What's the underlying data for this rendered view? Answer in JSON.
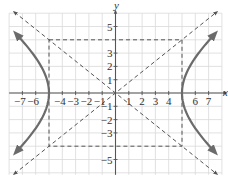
{
  "chart_data": {
    "type": "line",
    "title": "",
    "equation": "x^2/25 - y^2/16 = 1",
    "xlabel": "x",
    "ylabel": "y",
    "xlim": [
      -8,
      8
    ],
    "ylim": [
      -6,
      6
    ],
    "grid": true,
    "x_tick_labels": [
      "-7",
      "-6",
      "-4",
      "-3",
      "-2",
      "-1",
      "1",
      "2",
      "3",
      "4",
      "6",
      "7"
    ],
    "x_tick_values": [
      -7,
      -6,
      -4,
      -3,
      -2,
      -1,
      1,
      2,
      3,
      4,
      6,
      7
    ],
    "y_tick_labels": [
      "5",
      "3",
      "2",
      "1",
      "-1",
      "-2",
      "-3",
      "-5"
    ],
    "y_tick_values": [
      5,
      3,
      2,
      1,
      -1,
      -2,
      -3,
      -5
    ],
    "vertices": [
      [
        -5,
        0
      ],
      [
        5,
        0
      ]
    ],
    "fundamental_rectangle": {
      "x": [
        -5,
        5
      ],
      "y": [
        -4,
        4
      ],
      "style": "dashed"
    },
    "asymptotes": [
      {
        "name": "y = 4/5 x",
        "slope": 0.8,
        "style": "dashed"
      },
      {
        "name": "y = -4/5 x",
        "slope": -0.8,
        "style": "dashed"
      }
    ],
    "series": [
      {
        "name": "right branch",
        "points": [
          [
            7.6,
            4.6
          ],
          [
            7,
            3.92
          ],
          [
            6,
            2.65
          ],
          [
            5.5,
            1.83
          ],
          [
            5,
            0
          ],
          [
            5.5,
            -1.83
          ],
          [
            6,
            -2.65
          ],
          [
            7,
            -3.92
          ],
          [
            7.6,
            -4.6
          ]
        ]
      },
      {
        "name": "left branch",
        "points": [
          [
            -7.6,
            4.6
          ],
          [
            -7,
            3.92
          ],
          [
            -6,
            2.65
          ],
          [
            -5.5,
            1.83
          ],
          [
            -5,
            0
          ],
          [
            -5.5,
            -1.83
          ],
          [
            -6,
            -2.65
          ],
          [
            -7,
            -3.92
          ],
          [
            -7.6,
            -4.6
          ]
        ]
      }
    ],
    "colors": {
      "curve": "#6b6b6b",
      "asymptote": "#555555",
      "grid": "#d9d9d9",
      "axis": "#555555"
    }
  }
}
